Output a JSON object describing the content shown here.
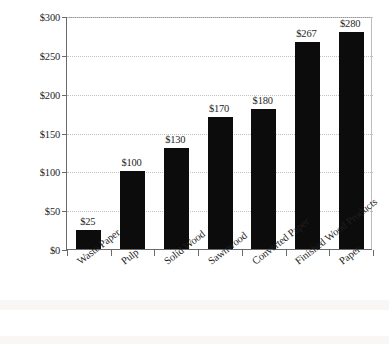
{
  "chart_data": {
    "type": "bar",
    "title": "",
    "xlabel": "",
    "ylabel": "US$billion",
    "categories": [
      "Waste Paper",
      "Pulp",
      "Solid Wood",
      "Sawnwood",
      "Converted Paper",
      "Finished Wood Products",
      "Paper"
    ],
    "values": [
      25,
      100,
      130,
      170,
      180,
      267,
      280
    ],
    "value_labels": [
      "$25",
      "$100",
      "$130",
      "$170",
      "$180",
      "$267",
      "$280"
    ],
    "ylim": [
      0,
      300
    ],
    "ytick_values": [
      0,
      50,
      100,
      150,
      200,
      250,
      300
    ],
    "ytick_labels": [
      "$0",
      "$50",
      "$100",
      "$150",
      "$200",
      "$250",
      "$300"
    ],
    "grid": "horizontal-dotted",
    "legend": "none",
    "bar_color": "#0c0c0c",
    "gridline_color": "#c2c2c2",
    "axis_color": "#6a6a6a",
    "background_color": "#ffffff"
  }
}
